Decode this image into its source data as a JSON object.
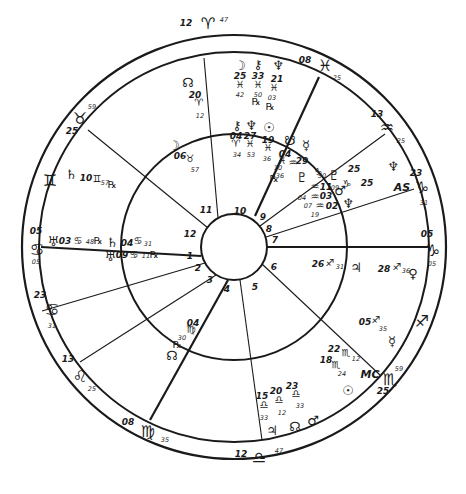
{
  "chart": {
    "type": "natal-bi-wheel",
    "center": [
      234,
      247
    ],
    "radii": {
      "outer": 212,
      "sign_band": 195,
      "inner": 113,
      "hub": 33
    },
    "colors": {
      "ink": "#1a1a1a",
      "paper": "#ffffff"
    }
  },
  "house_cusps": [
    {
      "house": "1",
      "label_pos": [
        190,
        259
      ],
      "line": [
        [
          201,
          256
        ],
        [
          41,
          247
        ]
      ],
      "bold": true
    },
    {
      "house": "2",
      "label_pos": [
        198,
        271
      ],
      "line": [
        [
          205,
          263
        ],
        [
          42,
          311
        ]
      ],
      "bold": false
    },
    {
      "house": "3",
      "label_pos": [
        210,
        283
      ],
      "line": [
        [
          216,
          275
        ],
        [
          80,
          362
        ]
      ],
      "bold": false
    },
    {
      "house": "4",
      "label_pos": [
        227,
        292
      ],
      "line": [
        [
          228,
          280
        ],
        [
          150,
          420
        ]
      ],
      "bold": true
    },
    {
      "house": "5",
      "label_pos": [
        255,
        290
      ],
      "line": [
        [
          240,
          280
        ],
        [
          262,
          440
        ]
      ],
      "bold": false
    },
    {
      "house": "6",
      "label_pos": [
        274,
        270
      ],
      "line": [
        [
          262,
          264
        ],
        [
          380,
          375
        ]
      ],
      "bold": false
    },
    {
      "house": "7",
      "label_pos": [
        275,
        243
      ],
      "line": [
        [
          267,
          247
        ],
        [
          428,
          247
        ]
      ],
      "bold": true
    },
    {
      "house": "8",
      "label_pos": [
        269,
        232
      ],
      "line": [
        [
          266,
          237
        ],
        [
          414,
          189
        ]
      ],
      "bold": false
    },
    {
      "house": "9",
      "label_pos": [
        263,
        220
      ],
      "line": [
        [
          260,
          226
        ],
        [
          385,
          134
        ]
      ],
      "bold": false
    },
    {
      "house": "10",
      "label_pos": [
        240,
        214
      ],
      "line": [
        [
          255,
          216
        ],
        [
          319,
          77
        ]
      ],
      "bold": true
    },
    {
      "house": "11",
      "label_pos": [
        206,
        213
      ],
      "line": [
        [
          218,
          218
        ],
        [
          204,
          58
        ]
      ],
      "bold": false
    },
    {
      "house": "12",
      "label_pos": [
        190,
        237
      ],
      "line": [
        [
          208,
          228
        ],
        [
          88,
          130
        ]
      ],
      "bold": false
    }
  ],
  "sign_ring": [
    {
      "sign": "aries",
      "glyph": "♈",
      "pos": [
        208,
        24
      ],
      "deg": "12",
      "deg_pos": [
        186,
        26
      ],
      "min": "47",
      "min_pos": [
        224,
        22
      ]
    },
    {
      "sign": "pisces",
      "glyph": "♓",
      "pos": [
        325,
        66
      ],
      "deg": "08",
      "deg_pos": [
        305,
        63
      ],
      "min": "25",
      "min_pos": [
        337,
        80
      ]
    },
    {
      "sign": "aquarius",
      "glyph": "♒",
      "pos": [
        387,
        128
      ],
      "deg": "13",
      "deg_pos": [
        377,
        117
      ],
      "min": "25",
      "min_pos": [
        401,
        143
      ]
    },
    {
      "sign": "capricorn-a",
      "glyph": "♑",
      "pos": [
        422,
        188
      ],
      "deg": "23",
      "deg_pos": [
        416,
        176
      ],
      "min": "31",
      "min_pos": [
        424,
        205
      ]
    },
    {
      "sign": "capricorn-b",
      "glyph": "♑",
      "pos": [
        433,
        251
      ],
      "deg": "05",
      "deg_pos": [
        427,
        237
      ],
      "min": "05",
      "min_pos": [
        432,
        266
      ]
    },
    {
      "sign": "sagittarius",
      "glyph": "♐",
      "pos": [
        422,
        322
      ],
      "deg": "",
      "deg_pos": [
        0,
        0
      ],
      "min": "",
      "min_pos": [
        0,
        0
      ]
    },
    {
      "sign": "scorpio",
      "glyph": "♏",
      "pos": [
        390,
        380
      ],
      "deg": "25",
      "deg_pos": [
        383,
        394
      ],
      "min": "59",
      "min_pos": [
        399,
        371
      ]
    },
    {
      "sign": "libra",
      "glyph": "♎",
      "pos": [
        259,
        458
      ],
      "deg": "12",
      "deg_pos": [
        241,
        457
      ],
      "min": "47",
      "min_pos": [
        279,
        453
      ]
    },
    {
      "sign": "virgo",
      "glyph": "♍",
      "pos": [
        148,
        432
      ],
      "deg": "08",
      "deg_pos": [
        128,
        425
      ],
      "min": "35",
      "min_pos": [
        165,
        442
      ]
    },
    {
      "sign": "leo",
      "glyph": "♌",
      "pos": [
        80,
        377
      ],
      "deg": "13",
      "deg_pos": [
        68,
        362
      ],
      "min": "25",
      "min_pos": [
        92,
        391
      ]
    },
    {
      "sign": "cancer-a",
      "glyph": "♋",
      "pos": [
        52,
        310
      ],
      "deg": "23",
      "deg_pos": [
        40,
        298
      ],
      "min": "31",
      "min_pos": [
        52,
        328
      ]
    },
    {
      "sign": "cancer-b",
      "glyph": "♋",
      "pos": [
        37,
        250
      ],
      "deg": "05",
      "deg_pos": [
        36,
        234
      ],
      "min": "05",
      "min_pos": [
        36,
        264
      ]
    },
    {
      "sign": "gemini",
      "glyph": "♊",
      "pos": [
        50,
        181
      ],
      "deg": "",
      "deg_pos": [
        0,
        0
      ],
      "min": "",
      "min_pos": [
        0,
        0
      ]
    },
    {
      "sign": "taurus",
      "glyph": "♉",
      "pos": [
        80,
        119
      ],
      "deg": "25",
      "deg_pos": [
        72,
        134
      ],
      "min": "59",
      "min_pos": [
        92,
        109
      ]
    }
  ],
  "outer_planets": [
    {
      "name": "north-node",
      "glyph": "☊",
      "pos": [
        188,
        83
      ],
      "lines": [
        {
          "t": "20",
          "x": 195,
          "y": 98,
          "c": "deg"
        },
        {
          "t": "♈",
          "x": 199,
          "y": 106,
          "c": "glyph"
        },
        {
          "t": "12",
          "x": 200,
          "y": 118,
          "c": "min"
        }
      ]
    },
    {
      "name": "moon",
      "glyph": "☽",
      "pos": [
        240,
        66
      ],
      "lines": [
        {
          "t": "25",
          "x": 240,
          "y": 79,
          "c": "deg"
        },
        {
          "t": "♓",
          "x": 240,
          "y": 88,
          "c": "glyph"
        },
        {
          "t": "42",
          "x": 240,
          "y": 97,
          "c": "min"
        }
      ]
    },
    {
      "name": "chiron",
      "glyph": "⚷",
      "pos": [
        258,
        65
      ],
      "lines": [
        {
          "t": "33",
          "x": 258,
          "y": 79,
          "c": "deg"
        },
        {
          "t": "♓",
          "x": 258,
          "y": 88,
          "c": "glyph"
        },
        {
          "t": "50",
          "x": 258,
          "y": 97,
          "c": "min"
        },
        {
          "t": "℞",
          "x": 256,
          "y": 105,
          "c": "glyph"
        }
      ]
    },
    {
      "name": "neptune",
      "glyph": "♆",
      "pos": [
        278,
        66
      ],
      "lines": [
        {
          "t": "21",
          "x": 277,
          "y": 82,
          "c": "deg"
        },
        {
          "t": "♓",
          "x": 274,
          "y": 91,
          "c": "glyph"
        },
        {
          "t": "03",
          "x": 272,
          "y": 100,
          "c": "min"
        },
        {
          "t": "℞",
          "x": 270,
          "y": 110,
          "c": "glyph"
        }
      ]
    },
    {
      "name": "saturn",
      "glyph": "♄",
      "pos": [
        71,
        175
      ],
      "lines": [
        {
          "t": "10",
          "x": 86,
          "y": 181,
          "c": "deg"
        },
        {
          "t": "♊",
          "x": 97,
          "y": 182,
          "c": "glyph"
        },
        {
          "t": "57",
          "x": 105,
          "y": 185,
          "c": "min"
        },
        {
          "t": "℞",
          "x": 112,
          "y": 188,
          "c": "glyph"
        }
      ]
    },
    {
      "name": "uranus",
      "glyph": "♅",
      "pos": [
        53,
        242
      ],
      "lines": [
        {
          "t": "03",
          "x": 65,
          "y": 244,
          "c": "deg"
        },
        {
          "t": "♋",
          "x": 78,
          "y": 244,
          "c": "glyph"
        },
        {
          "t": "48",
          "x": 90,
          "y": 244,
          "c": "min"
        },
        {
          "t": "℞",
          "x": 98,
          "y": 244,
          "c": "glyph"
        }
      ]
    },
    {
      "name": "pluto",
      "glyph": "♇",
      "pos": [
        334,
        176
      ],
      "lines": [
        {
          "t": "50",
          "x": 322,
          "y": 178,
          "c": "min"
        },
        {
          "t": "♑",
          "x": 318,
          "y": 175,
          "c": "glyph"
        },
        {
          "t": "25",
          "x": 354,
          "y": 172,
          "c": "deg"
        }
      ]
    },
    {
      "name": "neptune-b",
      "glyph": "♆",
      "pos": [
        393,
        167
      ],
      "lines": []
    },
    {
      "name": "ascendant",
      "glyph": "AS",
      "pos": [
        402,
        188
      ],
      "lines": [
        {
          "t": "09",
          "x": 335,
          "y": 190,
          "c": "min"
        },
        {
          "t": "♑",
          "x": 347,
          "y": 187,
          "c": "glyph"
        },
        {
          "t": "25",
          "x": 367,
          "y": 186,
          "c": "deg"
        }
      ]
    },
    {
      "name": "venus",
      "glyph": "♀",
      "pos": [
        413,
        274
      ],
      "lines": [
        {
          "t": "28",
          "x": 384,
          "y": 272,
          "c": "deg"
        },
        {
          "t": "♐",
          "x": 397,
          "y": 270,
          "c": "glyph"
        },
        {
          "t": "36",
          "x": 406,
          "y": 273,
          "c": "min"
        }
      ]
    },
    {
      "name": "mercury",
      "glyph": "☿",
      "pos": [
        392,
        342
      ],
      "lines": [
        {
          "t": "05",
          "x": 365,
          "y": 325,
          "c": "deg"
        },
        {
          "t": "♐",
          "x": 376,
          "y": 323,
          "c": "glyph"
        },
        {
          "t": "35",
          "x": 383,
          "y": 331,
          "c": "min"
        }
      ]
    },
    {
      "name": "midheaven",
      "glyph": "MC",
      "pos": [
        370,
        375
      ],
      "lines": []
    },
    {
      "name": "sun",
      "glyph": "☉",
      "pos": [
        348,
        391
      ],
      "lines": []
    },
    {
      "name": "jupiter-b",
      "glyph": "♃",
      "pos": [
        272,
        431
      ],
      "lines": []
    },
    {
      "name": "north-node-b",
      "glyph": "☊",
      "pos": [
        295,
        427
      ],
      "lines": []
    },
    {
      "name": "mars-b",
      "glyph": "♂",
      "pos": [
        313,
        421
      ],
      "lines": []
    }
  ],
  "outer_scorpio_cluster": [
    {
      "t": "22",
      "x": 334,
      "y": 352,
      "c": "deg"
    },
    {
      "t": "♏",
      "x": 346,
      "y": 356,
      "c": "glyph"
    },
    {
      "t": "12",
      "x": 356,
      "y": 361,
      "c": "min"
    },
    {
      "t": "18",
      "x": 326,
      "y": 363,
      "c": "deg"
    },
    {
      "t": "♏",
      "x": 336,
      "y": 368,
      "c": "glyph"
    },
    {
      "t": "24",
      "x": 342,
      "y": 376,
      "c": "min"
    }
  ],
  "outer_libra_cluster": [
    {
      "t": "15",
      "x": 262,
      "y": 399,
      "c": "deg"
    },
    {
      "t": "♎",
      "x": 264,
      "y": 408,
      "c": "glyph"
    },
    {
      "t": "33",
      "x": 264,
      "y": 420,
      "c": "min"
    },
    {
      "t": "20",
      "x": 276,
      "y": 394,
      "c": "deg"
    },
    {
      "t": "♎",
      "x": 279,
      "y": 403,
      "c": "glyph"
    },
    {
      "t": "12",
      "x": 282,
      "y": 415,
      "c": "min"
    },
    {
      "t": "23",
      "x": 292,
      "y": 389,
      "c": "deg"
    },
    {
      "t": "♎",
      "x": 296,
      "y": 397,
      "c": "glyph"
    },
    {
      "t": "33",
      "x": 300,
      "y": 408,
      "c": "min"
    }
  ],
  "inner_planets": [
    {
      "name": "moon-inner",
      "glyph": "☽",
      "pos": [
        174,
        146
      ],
      "lines": [
        {
          "t": "06",
          "x": 180,
          "y": 159,
          "c": "deg"
        },
        {
          "t": "♉",
          "x": 190,
          "y": 162,
          "c": "glyph"
        },
        {
          "t": "57",
          "x": 195,
          "y": 172,
          "c": "min"
        }
      ]
    },
    {
      "name": "chiron-inner",
      "glyph": "⚷",
      "pos": [
        237,
        126
      ],
      "lines": [
        {
          "t": "04",
          "x": 236,
          "y": 139,
          "c": "deg"
        },
        {
          "t": "♈",
          "x": 236,
          "y": 147,
          "c": "glyph"
        },
        {
          "t": "34",
          "x": 237,
          "y": 157,
          "c": "min"
        }
      ]
    },
    {
      "name": "neptune-inner",
      "glyph": "♆",
      "pos": [
        251,
        126
      ],
      "lines": [
        {
          "t": "27",
          "x": 250,
          "y": 139,
          "c": "deg"
        },
        {
          "t": "♓",
          "x": 250,
          "y": 147,
          "c": "glyph"
        },
        {
          "t": "53",
          "x": 251,
          "y": 157,
          "c": "min"
        }
      ]
    },
    {
      "name": "sun-inner",
      "glyph": "☉",
      "pos": [
        269,
        128
      ],
      "lines": [
        {
          "t": "19",
          "x": 268,
          "y": 143,
          "c": "deg"
        },
        {
          "t": "♓",
          "x": 268,
          "y": 151,
          "c": "glyph"
        },
        {
          "t": "36",
          "x": 267,
          "y": 161,
          "c": "min"
        }
      ]
    },
    {
      "name": "south-node-inner",
      "glyph": "☋",
      "pos": [
        290,
        141
      ],
      "lines": [
        {
          "t": "04",
          "x": 285,
          "y": 157,
          "c": "deg"
        },
        {
          "t": "♓",
          "x": 282,
          "y": 164,
          "c": "glyph"
        },
        {
          "t": "10",
          "x": 278,
          "y": 170,
          "c": "min"
        },
        {
          "t": "36",
          "x": 280,
          "y": 178,
          "c": "min"
        },
        {
          "t": "℞",
          "x": 274,
          "y": 182,
          "c": "glyph"
        }
      ]
    },
    {
      "name": "mercury-inner",
      "glyph": "☿",
      "pos": [
        306,
        146
      ],
      "lines": [
        {
          "t": "♒",
          "x": 293,
          "y": 166,
          "c": "glyph"
        },
        {
          "t": "29",
          "x": 302,
          "y": 164,
          "c": "deg"
        }
      ]
    },
    {
      "name": "pluto-inner",
      "glyph": "♇",
      "pos": [
        302,
        178
      ],
      "lines": []
    },
    {
      "name": "mars-inner",
      "glyph": "♂",
      "pos": [
        340,
        191
      ],
      "lines": []
    },
    {
      "name": "neptune-inner-b",
      "glyph": "♆",
      "pos": [
        348,
        204
      ],
      "lines": []
    },
    {
      "name": "jupiter-inner",
      "glyph": "♃",
      "pos": [
        356,
        268
      ],
      "lines": [
        {
          "t": "26",
          "x": 318,
          "y": 267,
          "c": "deg"
        },
        {
          "t": "♐",
          "x": 330,
          "y": 266,
          "c": "glyph"
        },
        {
          "t": "31",
          "x": 340,
          "y": 269,
          "c": "min"
        }
      ]
    },
    {
      "name": "saturn-inner",
      "glyph": "♄",
      "pos": [
        112,
        243
      ],
      "lines": [
        {
          "t": "04",
          "x": 127,
          "y": 246,
          "c": "deg"
        },
        {
          "t": "♋",
          "x": 138,
          "y": 244,
          "c": "glyph"
        },
        {
          "t": "31",
          "x": 148,
          "y": 246,
          "c": "min"
        }
      ]
    },
    {
      "name": "uranus-inner",
      "glyph": "♅",
      "pos": [
        110,
        257
      ],
      "lines": [
        {
          "t": "09",
          "x": 122,
          "y": 258,
          "c": "deg"
        },
        {
          "t": "♋",
          "x": 134,
          "y": 258,
          "c": "glyph"
        },
        {
          "t": "11",
          "x": 146,
          "y": 258,
          "c": "min"
        },
        {
          "t": "℞",
          "x": 154,
          "y": 258,
          "c": "glyph"
        }
      ]
    },
    {
      "name": "north-node-inner",
      "glyph": "☊",
      "pos": [
        172,
        356
      ],
      "lines": [
        {
          "t": "04",
          "x": 193,
          "y": 326,
          "c": "deg"
        },
        {
          "t": "♍",
          "x": 191,
          "y": 333,
          "c": "glyph"
        },
        {
          "t": "30",
          "x": 182,
          "y": 340,
          "c": "min"
        },
        {
          "t": "℞",
          "x": 177,
          "y": 348,
          "c": "glyph"
        }
      ]
    }
  ],
  "inner_aquarius_cluster": [
    {
      "t": "04",
      "x": 302,
      "y": 200,
      "c": "min"
    },
    {
      "t": "♒",
      "x": 315,
      "y": 200,
      "c": "glyph"
    },
    {
      "t": "03",
      "x": 326,
      "y": 199,
      "c": "deg"
    },
    {
      "t": "07",
      "x": 308,
      "y": 208,
      "c": "min"
    },
    {
      "t": "♒",
      "x": 320,
      "y": 209,
      "c": "glyph"
    },
    {
      "t": "02",
      "x": 332,
      "y": 209,
      "c": "deg"
    },
    {
      "t": "19",
      "x": 315,
      "y": 217,
      "c": "min"
    },
    {
      "t": "♒",
      "x": 315,
      "y": 190,
      "c": "glyph"
    },
    {
      "t": "11",
      "x": 326,
      "y": 190,
      "c": "deg"
    }
  ]
}
